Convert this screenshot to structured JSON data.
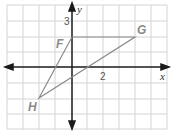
{
  "diagram": {
    "type": "coordinate-plane-triangle",
    "axes": {
      "x_label": "x",
      "y_label": "y"
    },
    "tick_labels": {
      "x": "2",
      "y": "3"
    },
    "grid": {
      "x_range": [
        -4,
        6
      ],
      "y_range": [
        -4,
        4
      ],
      "unit": 1
    },
    "points": [
      {
        "name": "F",
        "x": 0,
        "y": 2
      },
      {
        "name": "G",
        "x": 4,
        "y": 2
      },
      {
        "name": "H",
        "x": -2,
        "y": -2
      }
    ],
    "colors": {
      "grid": "#d0d0d0",
      "axis": "#1a1a1a",
      "triangle": "#8a8a8a",
      "label": "#8a8a8a"
    }
  }
}
